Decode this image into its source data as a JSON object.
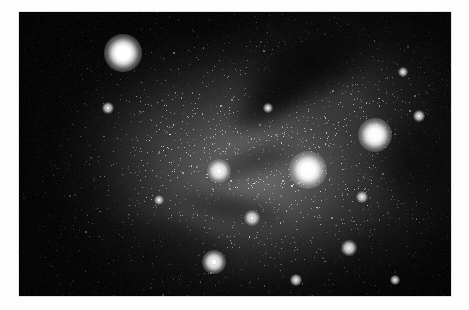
{
  "page": {
    "background_color": "#fdfdfd",
    "width": 469,
    "height": 310,
    "caption": ""
  },
  "photo": {
    "title": "",
    "kind": "astrophotograph",
    "subject": "dense milky way star field with bright and dark nebulosity",
    "color_mode": "monochrome",
    "frame": {
      "x": 19,
      "y": 12,
      "width": 432,
      "height": 284
    },
    "background_color": "#050505",
    "nebula_glow_color": "#767676",
    "star_color": "#ffffff",
    "alt_text": "Black and white photograph of a crowded star field. A diffuse luminous nebula fills the centre of the frame, fading into darkness toward the left and lower-left corners. Dark obscuring dust lanes cut across the upper-right and centre of the field. Several bright stars stand out against thousands of faint points of light."
  },
  "chart_data": {
    "type": "scatter",
    "title": "",
    "xlabel": "",
    "ylabel": "",
    "xlim": [
      0,
      432
    ],
    "ylim": [
      0,
      284
    ],
    "grid": false,
    "legend": "none",
    "note": "Positions are in pixels relative to the photographic plate; size is the apparent stellar disc diameter in pixels and brightness is normalised 0-1.",
    "bright_stars": [
      {
        "id": "star-a",
        "x": 104,
        "y": 41,
        "size": 12,
        "brightness": 1.0
      },
      {
        "id": "star-b",
        "x": 356,
        "y": 123,
        "size": 11,
        "brightness": 0.96
      },
      {
        "id": "star-c",
        "x": 289,
        "y": 158,
        "size": 12,
        "brightness": 0.98
      },
      {
        "id": "star-d",
        "x": 200,
        "y": 159,
        "size": 8,
        "brightness": 0.8
      },
      {
        "id": "star-e",
        "x": 195,
        "y": 250,
        "size": 8,
        "brightness": 0.78
      },
      {
        "id": "star-f",
        "x": 330,
        "y": 236,
        "size": 5,
        "brightness": 0.62
      },
      {
        "id": "star-g",
        "x": 233,
        "y": 206,
        "size": 5,
        "brightness": 0.6
      },
      {
        "id": "star-h",
        "x": 400,
        "y": 104,
        "size": 4,
        "brightness": 0.55
      },
      {
        "id": "star-i",
        "x": 277,
        "y": 268,
        "size": 4,
        "brightness": 0.52
      },
      {
        "id": "star-j",
        "x": 89,
        "y": 96,
        "size": 4,
        "brightness": 0.5
      },
      {
        "id": "star-k",
        "x": 343,
        "y": 185,
        "size": 4,
        "brightness": 0.5
      },
      {
        "id": "star-l",
        "x": 249,
        "y": 96,
        "size": 3,
        "brightness": 0.45
      },
      {
        "id": "star-m",
        "x": 384,
        "y": 60,
        "size": 3,
        "brightness": 0.44
      },
      {
        "id": "star-n",
        "x": 140,
        "y": 188,
        "size": 3,
        "brightness": 0.42
      },
      {
        "id": "star-o",
        "x": 376,
        "y": 268,
        "size": 3,
        "brightness": 0.42
      }
    ],
    "dust_lanes": [
      {
        "id": "lane-upper-right",
        "cx": 288,
        "cy": 56,
        "rx": 70,
        "ry": 34,
        "rotation": -22,
        "opacity": 0.88
      },
      {
        "id": "lane-upper-right-2",
        "cx": 250,
        "cy": 92,
        "rx": 44,
        "ry": 20,
        "rotation": -30,
        "opacity": 0.72
      },
      {
        "id": "lane-centre",
        "cx": 236,
        "cy": 150,
        "rx": 46,
        "ry": 17,
        "rotation": -18,
        "opacity": 0.52
      },
      {
        "id": "lane-centre-low",
        "cx": 214,
        "cy": 196,
        "rx": 56,
        "ry": 15,
        "rotation": 10,
        "opacity": 0.46
      },
      {
        "id": "lane-right",
        "cx": 395,
        "cy": 150,
        "rx": 40,
        "ry": 46,
        "rotation": 0,
        "opacity": 0.55
      },
      {
        "id": "lane-lower-left",
        "cx": 150,
        "cy": 232,
        "rx": 62,
        "ry": 26,
        "rotation": 14,
        "opacity": 0.4
      }
    ],
    "nebula_brightness_profile": {
      "peak_position": [
        233,
        159
      ],
      "peak_value": 0.46,
      "corner_values": {
        "top_left": 0.04,
        "top_right": 0.03,
        "bottom_left": 0.03,
        "bottom_right": 0.05
      }
    }
  }
}
